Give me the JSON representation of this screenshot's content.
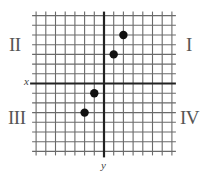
{
  "diagram": {
    "type": "coordinate-plane",
    "grid": {
      "x_min": -7,
      "x_max": 7,
      "y_min": -7,
      "y_max": 7,
      "cell_px": 9.7,
      "origin_px": [
        104,
        83.5
      ],
      "line_color": "#6a6a6a",
      "axis_color": "#222222"
    },
    "axis_labels": {
      "x": "x",
      "y": "y"
    },
    "quadrants": {
      "I": "I",
      "II": "II",
      "III": "III",
      "IV": "IV"
    },
    "points": [
      {
        "x": 2,
        "y": 5
      },
      {
        "x": 1,
        "y": 3
      },
      {
        "x": -1,
        "y": -1
      },
      {
        "x": -2,
        "y": -3
      }
    ],
    "point_color": "#111111"
  },
  "chart_data": {
    "type": "scatter",
    "title": "",
    "xlabel": "x",
    "ylabel": "y",
    "xlim": [
      -7,
      7
    ],
    "ylim": [
      -7,
      7
    ],
    "grid": true,
    "series": [
      {
        "name": "points",
        "x": [
          2,
          1,
          -1,
          -2
        ],
        "y": [
          5,
          3,
          -1,
          -3
        ]
      }
    ],
    "annotations": [
      "I",
      "II",
      "III",
      "IV"
    ]
  }
}
